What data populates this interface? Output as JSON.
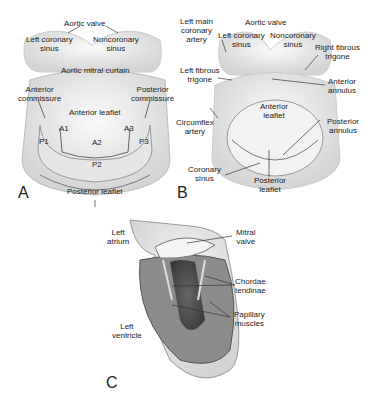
{
  "panels": {
    "A": {
      "letter": "A",
      "labels": {
        "aortic_valve": "Aortic valve",
        "left_coronary_sinus": "Left coronary\nsinus",
        "noncoronary_sinus": "Noncoronary\nsinus",
        "aortic_mitral_curtain": "Aortic mitral curtain",
        "anterior_commissure": "Anterior\ncommissure",
        "posterior_commissure": "Posterior\ncommissure",
        "anterior_leaflet": "Anterior leaflet",
        "a1": "A1",
        "a2": "A2",
        "a3": "A3",
        "p1": "P1",
        "p2": "P2",
        "p3": "P3",
        "posterior_leaflet": "Posterior leaflet"
      }
    },
    "B": {
      "letter": "B",
      "labels": {
        "left_main_coronary_artery": "Left main\ncoronary\nartery",
        "aortic_valve": "Aortic valve",
        "left_coronary_sinus": "Left coronary\nsinus",
        "noncoronary_sinus": "Noncoronary\nsinus",
        "right_fibrous_trigone": "Right fibrous\ntrigone",
        "left_fibrous_trigone": "Left fibrous\ntrigone",
        "anterior_annulus": "Anterior\nannulus",
        "anterior_leaflet": "Anterior\nleaflet",
        "circumflex_artery": "Circumflex\nartery",
        "posterior_annulus": "Posterior\nannulus",
        "coronary_sinus": "Coronary\nsinus",
        "posterior_leaflet": "Posterior\nleaflet"
      }
    },
    "C": {
      "letter": "C",
      "labels": {
        "left_atrium": "Left\natrium",
        "mitral_valve": "Mitral\nvalve",
        "chordae_tendinae": "Chordae\ntendinae",
        "papillary_muscles": "Papillary\nmuscles",
        "left_ventricle": "Left\nventricle"
      }
    }
  }
}
